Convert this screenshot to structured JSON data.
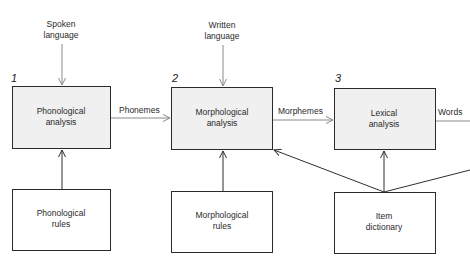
{
  "diagram": {
    "inputs": [
      {
        "id": "spoken",
        "lines": [
          "Spoken",
          "language"
        ]
      },
      {
        "id": "written",
        "lines": [
          "Written",
          "language"
        ]
      }
    ],
    "stages": [
      {
        "number": "1",
        "lines": [
          "Phonological",
          "analysis"
        ]
      },
      {
        "number": "2",
        "lines": [
          "Morphological",
          "analysis"
        ]
      },
      {
        "number": "3",
        "lines": [
          "Lexical",
          "analysis"
        ]
      }
    ],
    "resources": [
      {
        "lines": [
          "Phonological",
          "rules"
        ]
      },
      {
        "lines": [
          "Morphological",
          "rules"
        ]
      },
      {
        "lines": [
          "Item",
          "dictionary"
        ]
      }
    ],
    "flows": [
      {
        "label": "Phonemes"
      },
      {
        "label": "Morphemes"
      },
      {
        "label": "Words"
      }
    ]
  }
}
